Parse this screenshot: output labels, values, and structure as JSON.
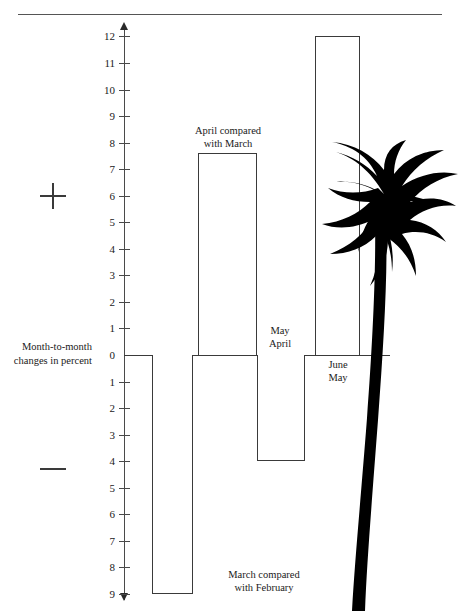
{
  "figure": {
    "caption_left": "Month-to-month\nchanges in percent",
    "sign_positive": "+",
    "sign_negative": "−",
    "overlay_icon": "palm-tree-silhouette"
  },
  "chart_data": {
    "type": "bar",
    "title": "",
    "subtitle": "",
    "xlabel": "",
    "ylabel": "Month-to-month changes in percent",
    "categories": [
      "March compared with February",
      "April compared with March",
      "May compared with April",
      "June compared with May"
    ],
    "values": [
      -9,
      7.6,
      -4,
      12
    ],
    "ylim": [
      -9,
      12
    ],
    "y_ticks_positive": [
      "12",
      "11",
      "10",
      "9",
      "8",
      "7",
      "6",
      "5",
      "4",
      "3",
      "2",
      "1",
      "0"
    ],
    "y_ticks_negative": [
      "1",
      "2",
      "3",
      "4",
      "5",
      "6",
      "7",
      "8",
      "9"
    ],
    "grid": false,
    "legend": "none",
    "axis_arrows": [
      "up",
      "down"
    ],
    "bar_fill": "#ffffff",
    "bar_stroke": "#3a3a3a",
    "zero_line": 0,
    "bars": [
      {
        "key": "march",
        "value": -9,
        "label": "March compared\nwith February",
        "label_side": "right",
        "label_x": 199,
        "label_y": 568,
        "label_w": 130,
        "x": 152,
        "width": 41
      },
      {
        "key": "april",
        "value": 7.6,
        "label": "April compared\nwith March",
        "label_side": "above",
        "label_x": 168,
        "label_y": 124,
        "label_w": 120,
        "x": 198,
        "width": 59
      },
      {
        "key": "may",
        "value": -4,
        "label": "May\nApril",
        "label_side": "above",
        "label_x": 255,
        "label_y": 324,
        "label_w": 50,
        "x": 257,
        "width": 48
      },
      {
        "key": "june",
        "value": 12,
        "label": "June\nMay",
        "label_side": "below",
        "label_x": 313,
        "label_y": 358,
        "label_w": 50,
        "x": 315,
        "width": 45
      }
    ]
  },
  "colors": {
    "ink": "#1a1a1a",
    "axis": "#4a4a4a",
    "bar_stroke": "#3a3a3a",
    "rule": "#555555",
    "palm": "#000000",
    "background": "#ffffff"
  }
}
